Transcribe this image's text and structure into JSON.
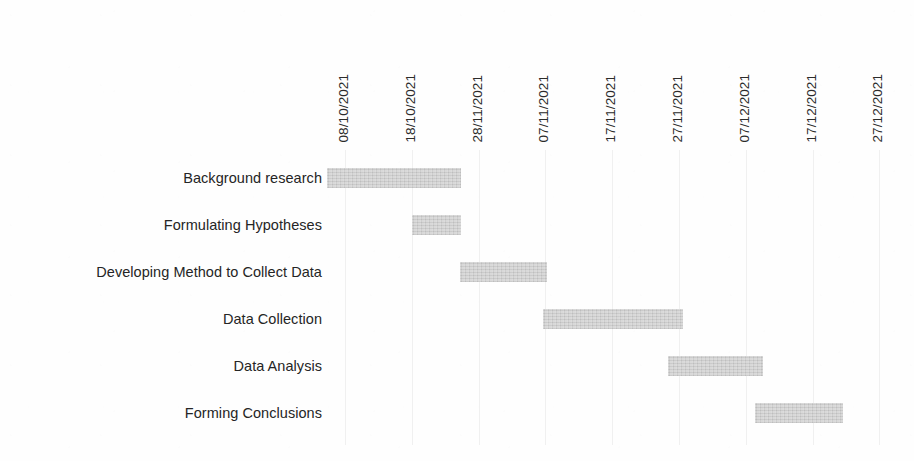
{
  "chart_data": {
    "type": "bar",
    "subtype": "gantt",
    "title": "",
    "xlabel": "",
    "ylabel": "",
    "orientation": "horizontal",
    "grid": true,
    "legend": false,
    "bar_color": "#cfcfcf",
    "background_color": "#ffffff",
    "text_color": "#231f20",
    "x_axis": {
      "position": "top",
      "label_rotation": -90,
      "tick_labels": [
        "08/10/2021",
        "18/10/2021",
        "28/11/2021",
        "07/11/2021",
        "17/11/2021",
        "27/11/2021",
        "07/12/2021",
        "17/12/2021",
        "27/12/2021",
        "06/01/2022"
      ],
      "tick_interval_days": 10,
      "xlim": [
        "08/10/2021",
        "06/01/2022"
      ]
    },
    "categories": [
      "Background research",
      "Formulating Hypotheses",
      "Data Collection",
      "Data Analysis",
      "Forming Conclusions",
      "Developing Method to Collect Data"
    ],
    "tasks": [
      {
        "name": "Background research",
        "start_label": "05/10/2021",
        "end_label": "25/10/2021",
        "start_units": -0.27,
        "duration_units": 2.0,
        "bar_left_px": 0,
        "bar_width_px": 134
      },
      {
        "name": "Formulating Hypotheses",
        "start_label": "18/10/2021",
        "end_label": "25/10/2021",
        "start_units": 1.0,
        "duration_units": 0.73,
        "bar_left_px": 85,
        "bar_width_px": 49
      },
      {
        "name": "Developing Method to Collect Data",
        "start_label": "25/10/2021",
        "end_label": "08/11/2021",
        "start_units": 1.99,
        "duration_units": 1.3,
        "bar_left_px": 133,
        "bar_width_px": 87
      },
      {
        "name": "Data Collection",
        "start_label": "07/11/2021",
        "end_label": "29/11/2021",
        "start_units": 3.23,
        "duration_units": 2.1,
        "bar_left_px": 216,
        "bar_width_px": 140
      },
      {
        "name": "Data Analysis",
        "start_label": "03/12/2021",
        "end_label": "17/12/2021",
        "start_units": 5.1,
        "duration_units": 1.42,
        "bar_left_px": 341,
        "bar_width_px": 95
      },
      {
        "name": "Forming Conclusions",
        "start_label": "14/12/2021",
        "end_label": "27/12/2021",
        "start_units": 6.13,
        "duration_units": 1.32,
        "bar_left_px": 428,
        "bar_width_px": 88
      }
    ]
  },
  "layout": {
    "plot_left_px": 327,
    "plot_top_px": 150,
    "tick_start_px": 18,
    "tick_spacing_px": 66.8,
    "row_height_px": 47,
    "first_row_top_px": 163,
    "bar_height_px": 20,
    "label_right_px": 322
  }
}
